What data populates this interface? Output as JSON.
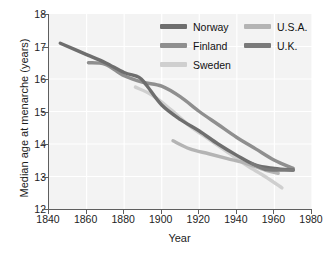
{
  "chart_data": {
    "type": "line",
    "title": "",
    "xlabel": "Year",
    "ylabel": "Median age at menarche (years)",
    "xlim": [
      1840,
      1980
    ],
    "ylim": [
      12,
      18
    ],
    "xticks": [
      1840,
      1860,
      1880,
      1900,
      1920,
      1940,
      1960,
      1980
    ],
    "yticks": [
      12,
      13,
      14,
      15,
      16,
      17,
      18
    ],
    "grid": true,
    "legend_position": "top-right",
    "series": [
      {
        "name": "Norway",
        "color": "#6e6e6e",
        "x": [
          1846,
          1860,
          1870,
          1880,
          1888,
          1892,
          1900,
          1910,
          1920,
          1930,
          1940,
          1950,
          1960,
          1970
        ],
        "y": [
          17.1,
          16.75,
          16.5,
          16.2,
          16.05,
          15.8,
          15.2,
          14.75,
          14.4,
          14.0,
          13.65,
          13.35,
          13.25,
          13.2
        ]
      },
      {
        "name": "Finland",
        "color": "#8f8f8f",
        "x": [
          1861,
          1870,
          1880,
          1890,
          1900,
          1910,
          1920,
          1930,
          1940,
          1950,
          1960,
          1970
        ],
        "y": [
          16.5,
          16.45,
          16.1,
          15.9,
          15.78,
          15.45,
          15.0,
          14.6,
          14.2,
          13.85,
          13.5,
          13.25
        ]
      },
      {
        "name": "Sweden",
        "color": "#cfcfcf",
        "x": [
          1886,
          1895,
          1905,
          1915,
          1925,
          1935,
          1945,
          1955,
          1964
        ],
        "y": [
          15.75,
          15.5,
          15.05,
          14.55,
          14.15,
          13.75,
          13.35,
          13.0,
          12.65
        ]
      },
      {
        "name": "U.S.A.",
        "color": "#b4b4b4",
        "x": [
          1906,
          1915,
          1925,
          1935,
          1945,
          1955,
          1962
        ],
        "y": [
          14.1,
          13.85,
          13.7,
          13.55,
          13.4,
          13.2,
          13.1
        ]
      },
      {
        "name": "U.K.",
        "color": "#7a7a7a",
        "x": [
          1948,
          1955,
          1962,
          1970
        ],
        "y": [
          13.4,
          13.22,
          13.2,
          13.2
        ]
      }
    ]
  },
  "legend": {
    "left_column": [
      {
        "label": "Norway",
        "color": "#6e6e6e"
      },
      {
        "label": "Finland",
        "color": "#8f8f8f"
      },
      {
        "label": "Sweden",
        "color": "#cfcfcf"
      }
    ],
    "right_column": [
      {
        "label": "U.S.A.",
        "color": "#b4b4b4"
      },
      {
        "label": "U.K.",
        "color": "#7a7a7a"
      }
    ]
  },
  "axes": {
    "x_label": "Year",
    "y_label": "Median age at menarche (years)",
    "x_tick_labels": [
      "1840",
      "1860",
      "1880",
      "1900",
      "1920",
      "1940",
      "1960",
      "1980"
    ],
    "y_tick_labels": [
      "12",
      "13",
      "14",
      "15",
      "16",
      "17",
      "18"
    ]
  },
  "style": {
    "plot_background": "#f3f3f3",
    "grid_color": "#ffffff",
    "axis_color": "#5e5e5e"
  }
}
